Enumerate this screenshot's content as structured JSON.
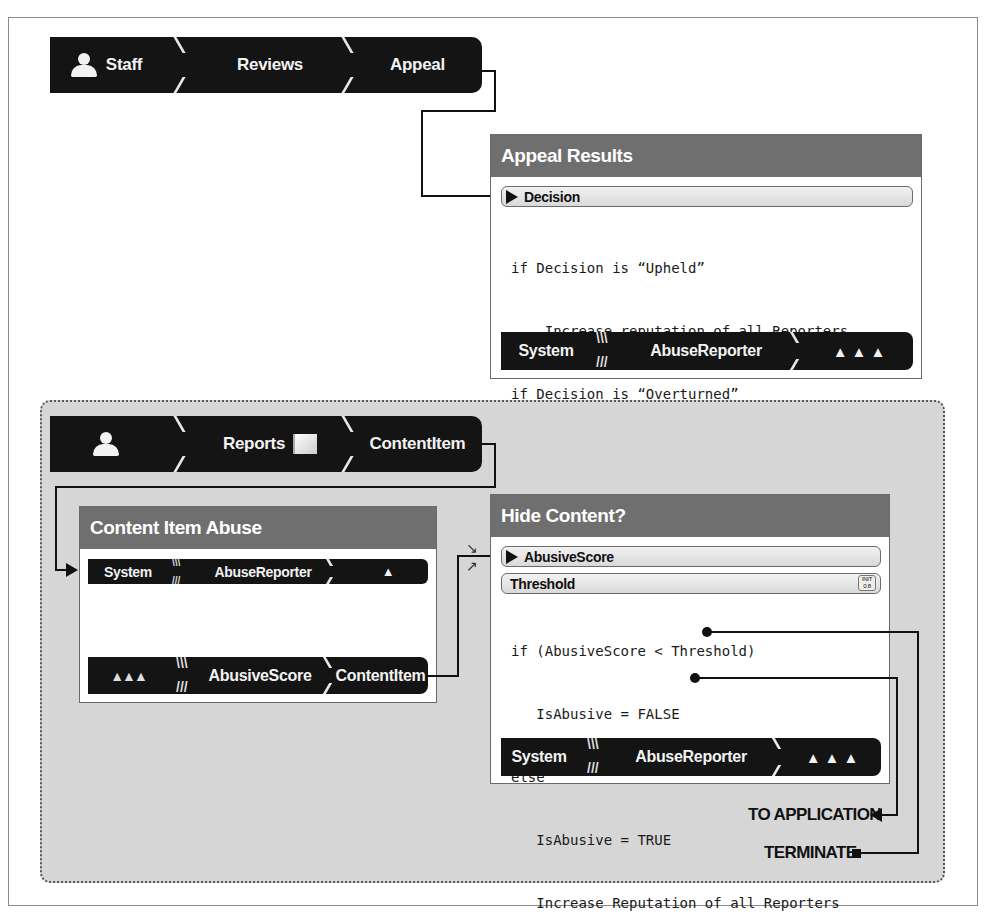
{
  "staff_bar": {
    "segments": [
      "Staff",
      "Reviews",
      "Appeal"
    ],
    "icon": "person-icon"
  },
  "appeal_results": {
    "title": "Appeal Results",
    "input_field": "Decision",
    "code_lines": [
      "if Decision is “Upheld”",
      "    Increase reputation of all Reporters",
      "if Decision is “Overturned”",
      "    Decrease reputation of all Reporters ×2"
    ],
    "footer": {
      "segments": [
        "System",
        "AbuseReporter"
      ],
      "icon": "three-persons-icon"
    }
  },
  "reports_bar": {
    "segments": [
      "",
      "Reports",
      "ContentItem"
    ],
    "icons": [
      "person-icon",
      "flag-icon"
    ]
  },
  "content_item_abuse": {
    "title": "Content Item Abuse",
    "header_bar": {
      "segments": [
        "System",
        "AbuseReporter"
      ],
      "icon": "person-icon"
    },
    "code_lines": [
      "AbusiveScore += AbuseReporter"
    ],
    "footer": {
      "segments": [
        "",
        "AbusiveScore",
        "ContentItem"
      ],
      "icon": "group-icon"
    }
  },
  "hide_content": {
    "title": "Hide Content?",
    "input_field": "AbusiveScore",
    "threshold_field": "Threshold",
    "threshold_init_label": "INIT",
    "threshold_init_value": "0.8",
    "code_lines": [
      "if (AbusiveScore < Threshold)",
      "   IsAbusive = FALSE",
      "else",
      "   IsAbusive = TRUE",
      "   Increase Reputation of all Reporters"
    ],
    "footer": {
      "segments": [
        "System",
        "AbuseReporter"
      ],
      "icon": "three-persons-icon"
    }
  },
  "outputs": {
    "to_application": "TO APPLICATION",
    "terminate": "TERMINATE"
  },
  "colors": {
    "bar_bg": "#141414",
    "card_header": "#6f6f6f",
    "region_bg": "#d6d6d6"
  }
}
